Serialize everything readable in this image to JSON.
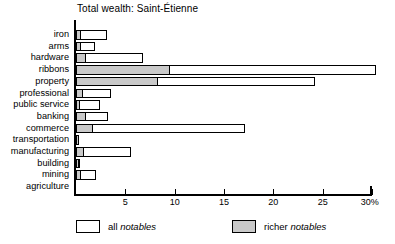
{
  "chart_data": {
    "type": "bar",
    "orientation": "horizontal",
    "stacked": false,
    "title": "Total wealth: Saint-Étienne",
    "xlabel": "",
    "ylabel": "",
    "xlim": [
      0,
      30
    ],
    "xunit": "%",
    "grid": false,
    "legend_position": "bottom",
    "categories": [
      "iron",
      "arms",
      "hardware",
      "ribbons",
      "property",
      "professional",
      "public service",
      "banking",
      "commerce",
      "transportation",
      "manufacturing",
      "building",
      "mining",
      "agriculture"
    ],
    "series": [
      {
        "name": "all notables",
        "color": "#ffffff",
        "values": [
          3.1,
          1.9,
          6.8,
          30.4,
          24.2,
          3.5,
          2.4,
          3.2,
          17.1,
          0.3,
          5.6,
          0.4,
          2.0,
          0.0
        ]
      },
      {
        "name": "richer notables",
        "color": "#c9c9c9",
        "values": [
          0.5,
          0.5,
          1.0,
          9.5,
          8.3,
          0.7,
          0.4,
          1.0,
          1.7,
          0.2,
          0.8,
          0.3,
          0.5,
          0.0
        ]
      }
    ],
    "xticks": [
      {
        "value": 0,
        "label": ""
      },
      {
        "value": 5,
        "label": "5"
      },
      {
        "value": 10,
        "label": "10"
      },
      {
        "value": 15,
        "label": "15"
      },
      {
        "value": 20,
        "label": "20"
      },
      {
        "value": 25,
        "label": "25"
      },
      {
        "value": 30,
        "label": "30%"
      }
    ]
  },
  "legend": {
    "items": [
      {
        "prefix": "all ",
        "emphasis": "notables",
        "key": "all-notables"
      },
      {
        "prefix": "richer ",
        "emphasis": "notables",
        "key": "richer-notables"
      }
    ]
  }
}
